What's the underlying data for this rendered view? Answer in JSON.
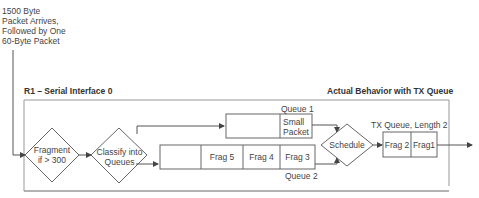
{
  "input_note": [
    "1500 Byte",
    "Packet Arrives,",
    "Followed by One",
    "60-Byte Packet"
  ],
  "router_label": "R1 – Serial Interface 0",
  "behavior_label": "Actual Behavior with TX Queue",
  "nodes": {
    "fragment": [
      "Fragment",
      "if > 300"
    ],
    "classify": [
      "Classify into",
      "Queues"
    ],
    "schedule": "Schedule"
  },
  "queue1": {
    "label": "Queue 1",
    "cells": [
      "",
      "Small Packet"
    ]
  },
  "queue2": {
    "label": "Queue 2",
    "cells": [
      "",
      "Frag 5",
      "Frag 4",
      "Frag 3"
    ]
  },
  "tx_queue": {
    "label": "TX Queue, Length 2",
    "cells": [
      "Frag 2",
      "Frag1"
    ]
  },
  "colors": {
    "line": "#555555",
    "border": "#888888"
  }
}
